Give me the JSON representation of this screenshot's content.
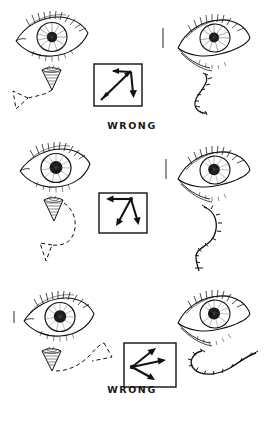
{
  "page": {
    "background_color": "#ffffff",
    "ink_color": "#111111",
    "width": 264,
    "height": 424
  },
  "panels": [
    {
      "id": "panel-wrong-1",
      "verdict": "WRONG",
      "left_eye": {
        "name": "left-eye-illustration",
        "description": "frontal open eye with lashes, striated iris, dark pupil"
      },
      "applicator": {
        "name": "cone-applicator-left",
        "description": "shaded cone / blender tip pointing down"
      },
      "left_path": {
        "name": "dashed-triangle-path-left",
        "style": "dashed",
        "shape": "triangle trailing down-left from cone"
      },
      "arrow_box": {
        "name": "arrow-direction-box-1",
        "arrows": [
          {
            "label": "up-left-arrow",
            "direction": "up-left"
          },
          {
            "label": "up-right-diagonal",
            "direction": "up-right"
          },
          {
            "label": "down-left-diagonal",
            "direction": "down-left"
          },
          {
            "label": "down-arrow",
            "direction": "down"
          }
        ],
        "summary": "double-headed diagonal with a downward branch"
      },
      "right_eye": {
        "name": "right-eye-illustration",
        "description": "three-quarter angled eye with under-eye lines"
      },
      "right_path": {
        "name": "ticked-s-curve-right",
        "style": "ticked",
        "shape": "vertical S-curve with cross ticks"
      }
    },
    {
      "id": "panel-wrong-2",
      "verdict": "WRONG",
      "left_eye": {
        "name": "left-eye-illustration",
        "description": "frontal open eye with heavy lash line and dark pupil"
      },
      "applicator": {
        "name": "cone-applicator-left",
        "description": "shaded cone / blender tip pointing down"
      },
      "left_path": {
        "name": "dashed-hook-triangle-path-left",
        "style": "dashed",
        "shape": "curve sweeping down into an open triangle"
      },
      "arrow_box": {
        "name": "arrow-direction-box-2",
        "arrows": [
          {
            "label": "left-arrow",
            "direction": "left"
          },
          {
            "label": "down-left-arrow",
            "direction": "down-left"
          },
          {
            "label": "down-right-arrow",
            "direction": "down-right"
          }
        ],
        "summary": "three arrows radiating from a top-right node"
      },
      "right_eye": {
        "name": "right-eye-illustration",
        "description": "three-quarter angled eye with lashes and brow hatching"
      },
      "right_path": {
        "name": "ticked-s-curve-right",
        "style": "ticked",
        "shape": "tall vertical S-curve with cross ticks"
      }
    },
    {
      "id": "panel-right",
      "verdict": "RIGHT",
      "left_eye": {
        "name": "left-eye-illustration",
        "description": "frontal open eye with lashes and striated iris"
      },
      "applicator": {
        "name": "cone-applicator-left",
        "description": "shaded cone / blender tip pointing down"
      },
      "left_path": {
        "name": "dashed-sweep-path-left",
        "style": "dashed",
        "shape": "curve sweeping up and outward to the right"
      },
      "arrow_box": {
        "name": "arrow-direction-box-3",
        "arrows": [
          {
            "label": "up-right-arrow",
            "direction": "up-right"
          },
          {
            "label": "right-arrow",
            "direction": "right"
          },
          {
            "label": "down-right-arrow",
            "direction": "down-right"
          }
        ],
        "summary": "three arrows fanning outward from a left node"
      },
      "right_eye": {
        "name": "right-eye-illustration",
        "description": "three-quarter angled eye with lashes and shading"
      },
      "right_path": {
        "name": "ticked-hook-curve-right",
        "style": "ticked",
        "shape": "horizontal hook curve with cross ticks"
      }
    }
  ]
}
